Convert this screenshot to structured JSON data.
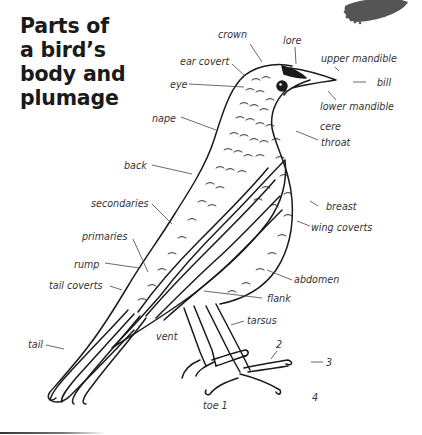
{
  "title": {
    "lines": [
      "Parts of",
      "a bird’s",
      "body and",
      "plumage"
    ]
  },
  "labels": {
    "crown": "crown",
    "lore": "lore",
    "ear_covert": "ear covert",
    "eye": "eye",
    "upper_mandible": "upper mandible",
    "bill": "bill",
    "lower_mandible": "lower mandible",
    "nape": "nape",
    "cere": "cere",
    "throat": "throat",
    "back": "back",
    "breast": "breast",
    "secondaries": "secondaries",
    "wing_coverts": "wing coverts",
    "primaries": "primaries",
    "rump": "rump",
    "abdomen": "abdomen",
    "tail_coverts": "tail coverts",
    "flank": "flank",
    "tarsus": "tarsus",
    "vent": "vent",
    "tail": "tail",
    "toe_2": "2",
    "toe_3": "3",
    "toe_4": "4",
    "toe_1": "toe 1"
  },
  "colors": {
    "ink": "#1a1a1a",
    "label": "#333333",
    "leader": "#444444",
    "feather_blob": "#555555"
  }
}
